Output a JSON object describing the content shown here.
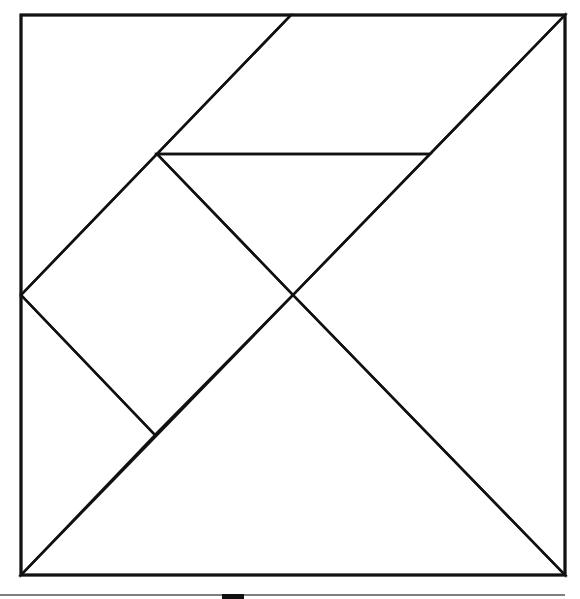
{
  "diagram": {
    "stroke_color": "#111111",
    "background": "#ffffff",
    "outer_square": {
      "x1": 21,
      "y1": 15,
      "x2": 565,
      "y2": 575
    },
    "pieces": [
      {
        "name": "large-triangle-bottom",
        "points": "21,575 565,575 293,295"
      },
      {
        "name": "large-triangle-right",
        "points": "565,15 565,575 293,295"
      },
      {
        "name": "medium-triangle-top",
        "points": "157,154 430,154 293,295"
      },
      {
        "name": "square",
        "points": "21,295 157,154 293,295 155,435"
      },
      {
        "name": "small-triangle-left",
        "points": "21,295 155,435 21,575"
      },
      {
        "name": "parallelogram-top",
        "points": "291,15 565,15 430,154 157,154"
      },
      {
        "name": "triangle-top-left",
        "points": "21,15 291,15 21,295"
      }
    ],
    "footer_line": {
      "x1": 0,
      "y1": 595,
      "x2": 565,
      "y2": 595,
      "color": "#555555"
    },
    "footer_mark": {
      "x": 222,
      "y": 594,
      "width": 22,
      "height": 5,
      "color": "#111111"
    }
  }
}
